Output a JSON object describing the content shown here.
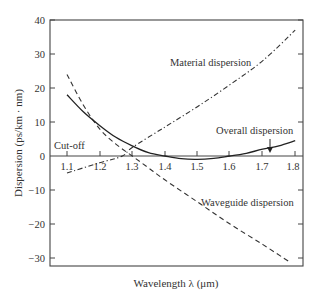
{
  "chart_data": {
    "type": "line",
    "title": "",
    "xlabel": "Wavelength λ (μm)",
    "ylabel": "Dispersion (ps/km · nm)",
    "xlim": [
      1.05,
      1.83
    ],
    "ylim": [
      -32.5,
      40
    ],
    "x_ticks": [
      "1.1",
      "1.2",
      "1.3",
      "1.4",
      "1.5",
      "1.6",
      "1.7",
      "1.8"
    ],
    "y_ticks": [
      "40",
      "30",
      "20",
      "10",
      "0",
      "−10",
      "−20",
      "−30"
    ],
    "grid": false,
    "legend": "none (inline annotations)",
    "series": [
      {
        "name": "Material dispersion",
        "style": "dash-dot",
        "x": [
          1.1,
          1.2,
          1.27,
          1.3,
          1.4,
          1.5,
          1.6,
          1.7,
          1.8
        ],
        "values": [
          -5,
          -2,
          0,
          2.5,
          8.5,
          14.5,
          21,
          28,
          37
        ]
      },
      {
        "name": "Waveguide dispersion",
        "style": "dashed",
        "x": [
          1.1,
          1.15,
          1.2,
          1.25,
          1.3,
          1.35,
          1.4,
          1.5,
          1.6,
          1.7,
          1.78
        ],
        "values": [
          24,
          15,
          8,
          3.5,
          0,
          -3.5,
          -7,
          -13.5,
          -20,
          -26,
          -31
        ]
      },
      {
        "name": "Overall dispersion",
        "style": "solid",
        "x": [
          1.1,
          1.15,
          1.2,
          1.25,
          1.3,
          1.35,
          1.4,
          1.45,
          1.5,
          1.55,
          1.6,
          1.65,
          1.7,
          1.75,
          1.8
        ],
        "values": [
          18,
          13,
          9,
          5.5,
          3,
          1,
          0,
          -0.8,
          -1,
          -0.7,
          0,
          0.8,
          2,
          3,
          4.5
        ]
      }
    ],
    "annotations": [
      {
        "text": "Material dispersion",
        "x": 1.52,
        "y": 24
      },
      {
        "text": "Overall dispersion",
        "x": 1.62,
        "y": 7.5
      },
      {
        "text": "Waveguide dispersion",
        "x": 1.55,
        "y": -11
      },
      {
        "text": "Cut-off",
        "x": 1.09,
        "y": 2.5
      }
    ]
  },
  "labels": {
    "material": "Material dispersion",
    "overall": "Overall dispersion",
    "waveguide": "Waveguide dispersion",
    "cutoff": "Cut-off",
    "xlabel": "Wavelength λ (μm)",
    "ylabel": "Dispersion (ps/km · nm)"
  },
  "ticks": {
    "x": [
      "1.1",
      "1.2",
      "1.3",
      "1.4",
      "1.5",
      "1.6",
      "1.7",
      "1.8"
    ],
    "y": [
      "40",
      "30",
      "20",
      "10",
      "0",
      "−10",
      "−20",
      "−30"
    ]
  }
}
